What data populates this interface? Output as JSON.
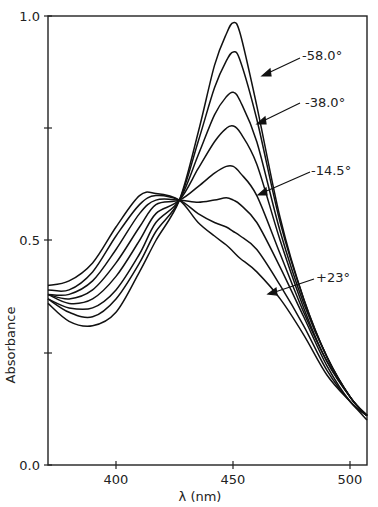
{
  "chart_data": {
    "type": "line",
    "title": "",
    "xlabel": "λ (nm)",
    "ylabel": "Absorbance",
    "xlim": [
      371,
      507
    ],
    "ylim": [
      0.0,
      1.0
    ],
    "grid": false,
    "x_ticks": [
      400,
      450,
      500
    ],
    "x_tick_labels": [
      "400",
      "450",
      "500"
    ],
    "y_ticks": [
      0.0,
      0.25,
      0.5,
      0.75,
      1.0
    ],
    "y_tick_labels": [
      "0.0",
      "",
      "0.5",
      "",
      "1.0"
    ],
    "isosbestic_point": {
      "x": 427,
      "y": 0.59
    },
    "annotations": [
      {
        "text": "-58.0°",
        "target_series": 0
      },
      {
        "text": "-38.0°",
        "target_series": 2
      },
      {
        "text": "-14.5°",
        "target_series": 4
      },
      {
        "text": "+23°",
        "target_series": 7
      }
    ],
    "x": [
      371,
      380,
      390,
      400,
      410,
      417,
      427,
      435,
      442,
      447,
      450,
      453,
      460,
      470,
      480,
      490,
      500,
      507
    ],
    "series": [
      {
        "name": "-58.0°",
        "values": [
          0.36,
          0.32,
          0.31,
          0.34,
          0.43,
          0.5,
          0.59,
          0.74,
          0.89,
          0.96,
          0.985,
          0.96,
          0.8,
          0.55,
          0.37,
          0.24,
          0.15,
          0.11
        ]
      },
      {
        "name": "series-2",
        "values": [
          0.37,
          0.34,
          0.33,
          0.37,
          0.45,
          0.52,
          0.59,
          0.72,
          0.84,
          0.9,
          0.92,
          0.9,
          0.77,
          0.54,
          0.37,
          0.24,
          0.15,
          0.11
        ]
      },
      {
        "name": "-38.0°",
        "values": [
          0.37,
          0.35,
          0.35,
          0.39,
          0.47,
          0.54,
          0.59,
          0.69,
          0.78,
          0.82,
          0.83,
          0.81,
          0.72,
          0.52,
          0.36,
          0.24,
          0.15,
          0.11
        ]
      },
      {
        "name": "series-4",
        "values": [
          0.38,
          0.36,
          0.37,
          0.42,
          0.5,
          0.56,
          0.59,
          0.66,
          0.72,
          0.75,
          0.755,
          0.74,
          0.67,
          0.5,
          0.35,
          0.23,
          0.15,
          0.11
        ]
      },
      {
        "name": "-14.5°",
        "values": [
          0.38,
          0.37,
          0.39,
          0.45,
          0.53,
          0.58,
          0.59,
          0.62,
          0.65,
          0.665,
          0.665,
          0.65,
          0.6,
          0.47,
          0.34,
          0.23,
          0.15,
          0.11
        ]
      },
      {
        "name": "series-6",
        "values": [
          0.38,
          0.38,
          0.41,
          0.48,
          0.56,
          0.59,
          0.59,
          0.585,
          0.59,
          0.595,
          0.59,
          0.58,
          0.54,
          0.44,
          0.33,
          0.22,
          0.14,
          0.11
        ]
      },
      {
        "name": "series-7",
        "values": [
          0.39,
          0.39,
          0.43,
          0.51,
          0.58,
          0.6,
          0.59,
          0.56,
          0.54,
          0.53,
          0.52,
          0.51,
          0.48,
          0.4,
          0.31,
          0.21,
          0.14,
          0.11
        ]
      },
      {
        "name": "+23°",
        "values": [
          0.4,
          0.41,
          0.45,
          0.53,
          0.6,
          0.605,
          0.59,
          0.54,
          0.51,
          0.49,
          0.475,
          0.46,
          0.43,
          0.37,
          0.29,
          0.2,
          0.14,
          0.1
        ]
      }
    ]
  },
  "labels": {
    "y_top": "1.0",
    "y_mid": "0.5",
    "y_bottom": "0.0",
    "x_400": "400",
    "x_450": "450",
    "x_500": "500",
    "xlabel": "λ (nm)",
    "ylabel": "Absorbance",
    "ann_58": "-58.0°",
    "ann_38": "-38.0°",
    "ann_14": "-14.5°",
    "ann_23": "+23°"
  }
}
